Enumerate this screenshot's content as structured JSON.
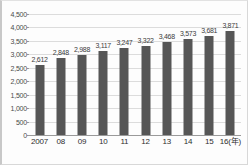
{
  "chart_data": {
    "type": "bar",
    "title": "",
    "xlabel": "16(年)",
    "ylabel": "",
    "categories": [
      "2007",
      "08",
      "09",
      "10",
      "11",
      "12",
      "13",
      "14",
      "15",
      "16(年)"
    ],
    "values": [
      2612,
      2848,
      2988,
      3117,
      3247,
      3322,
      3468,
      3573,
      3681,
      3871
    ],
    "value_labels": [
      "2,612",
      "2,848",
      "2,988",
      "3,117",
      "3,247",
      "3,322",
      "3,468",
      "3,573",
      "3,681",
      "3,871"
    ],
    "ylim": [
      0,
      4500
    ],
    "ytick_values": [
      0,
      500,
      1000,
      1500,
      2000,
      2500,
      3000,
      3500,
      4000,
      4500
    ],
    "ytick_labels": [
      "0",
      "500",
      "1,000",
      "1,500",
      "2,000",
      "2,500",
      "3,000",
      "3,500",
      "4,000",
      "4,500"
    ],
    "grid": true,
    "legend": null,
    "legend_position": "none",
    "bar_color": "#565656",
    "grid_color": "#dcdcdc",
    "axis_color": "#9a9a9a",
    "background_color": "#fdfdfd"
  }
}
